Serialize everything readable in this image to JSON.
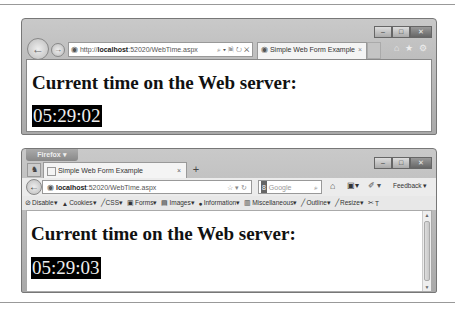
{
  "ie_window": {
    "address": {
      "prefix": "http://",
      "host": "localhost",
      "rest": ":52020/WebTime.aspx"
    },
    "address_controls": [
      "⌕ ▾",
      "🗎",
      "↻",
      "✕"
    ],
    "tab_title": "Simple Web Form Example",
    "tab_close": "×",
    "toolbar_icons": [
      "⌂",
      "★",
      "⚙"
    ],
    "heading": "Current time on the Web server:",
    "time": "05:29:02"
  },
  "firefox_window": {
    "menu_button": "Firefox ▾",
    "tab_title": "Simple Web Form Example",
    "tab_close": "×",
    "new_tab": "+",
    "address": {
      "host": "localhost",
      "rest": ":52020/WebTime.aspx"
    },
    "search_placeholder": "Google",
    "feedback_label": "Feedback ▾",
    "webdev_toolbar": [
      {
        "icon": "⊘",
        "label": "Disable▾"
      },
      {
        "icon": "▲",
        "label": "Cookies▾"
      },
      {
        "icon": "╱",
        "label": "CSS▾"
      },
      {
        "icon": "▣",
        "label": "Forms▾"
      },
      {
        "icon": "▤",
        "label": "Images▾"
      },
      {
        "icon": "●",
        "label": "Information▾"
      },
      {
        "icon": "▥",
        "label": "Miscellaneous▾"
      },
      {
        "icon": "╱",
        "label": "Outline▾"
      },
      {
        "icon": "╱",
        "label": "Resize▾"
      },
      {
        "icon": "✂",
        "label": "T"
      }
    ],
    "heading": "Current time on the Web server:",
    "time": "05:29:03"
  },
  "window_buttons": {
    "minimize": "–",
    "maximize": "□",
    "close": "✕"
  }
}
